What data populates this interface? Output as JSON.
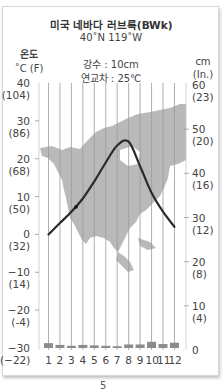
{
  "figure": {
    "title": "미국 네바다 러브록(BWk)",
    "coordinates": "40˚N 119˚W",
    "precipitation_label": "강수 : 10cm",
    "annual_range_label": "연교차 : 25℃",
    "left_axis_title": "온도",
    "left_axis_unit": "˚C (F)",
    "right_axis_title": "cm",
    "right_axis_unit": "(In.)",
    "page_number_fragment": "5"
  },
  "chart_data": {
    "type": "bar+line",
    "annotations": [
      "강수 : 10cm",
      "연교차 : 25℃"
    ],
    "categories": [
      "1",
      "2",
      "3",
      "4",
      "5",
      "6",
      "7",
      "8",
      "9",
      "10",
      "11",
      "12"
    ],
    "series": [
      {
        "name": "기온 (˚C)",
        "type": "line",
        "axis": "left",
        "values": [
          0,
          3,
          6,
          9.5,
          14,
          19,
          23.5,
          24.5,
          18,
          11,
          6,
          2
        ]
      },
      {
        "name": "강수량 (cm)",
        "type": "bar",
        "axis": "right",
        "values": [
          1.1,
          0.7,
          0.5,
          0.7,
          0.6,
          0.5,
          0.4,
          0.8,
          0.8,
          1.4,
          0.9,
          1.2
        ]
      }
    ],
    "left_axis": {
      "label": "온도 ˚C (F)",
      "ylim": [
        -30,
        40
      ],
      "ticks": [
        {
          "c": "40",
          "f": "(104)"
        },
        {
          "c": "30",
          "f": "(86)"
        },
        {
          "c": "20",
          "f": "(68)"
        },
        {
          "c": "10",
          "f": "(50)"
        },
        {
          "c": "0",
          "f": "(32)"
        },
        {
          "c": "−10",
          "f": "(14)"
        },
        {
          "c": "−20",
          "f": "(-4)"
        },
        {
          "c": "−30",
          "f": "(−22)"
        }
      ]
    },
    "right_axis": {
      "label": "cm (In.)",
      "ylim": [
        0,
        60
      ],
      "ticks": [
        {
          "cm": "60",
          "in": "(23)"
        },
        {
          "cm": "50",
          "in": "(20)"
        },
        {
          "cm": "40",
          "in": "(16)"
        },
        {
          "cm": "30",
          "in": "(12)"
        },
        {
          "cm": "20",
          "in": "(8)"
        },
        {
          "cm": "10",
          "in": "(4)"
        },
        {
          "cm": "0",
          "in": ""
        }
      ]
    },
    "background": "North America map silhouette",
    "grid": "vertical month lines",
    "colors": {
      "line": "#2b2b2b",
      "bars": "#8c8c8c",
      "map": "#b9b9b9",
      "grid": "#9a9a9a"
    }
  }
}
